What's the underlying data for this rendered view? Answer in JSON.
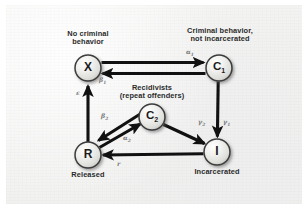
{
  "diagram": {
    "background_color": "#f2f2f1",
    "frame_color": "#ffffff",
    "node_fill": "#e9e9e7",
    "node_stroke": "#3c3c3c",
    "arrow_color": "#111111",
    "label_color": "#2b2b2b",
    "rate_color": "#7c7c7c"
  },
  "nodes": [
    {
      "id": "X",
      "label": "X",
      "sub": "",
      "cx": 88,
      "cy": 68,
      "r": 13,
      "caption": "No criminal\nbehavior",
      "caption_pos": "above"
    },
    {
      "id": "C1",
      "label": "C",
      "sub": "1",
      "cx": 219,
      "cy": 68,
      "r": 13,
      "caption": "Criminal behavior,\nnot incarcerated",
      "caption_pos": "above"
    },
    {
      "id": "C2",
      "label": "C",
      "sub": "2",
      "cx": 152,
      "cy": 117,
      "r": 13,
      "caption": "Recidivists\n(repeat offenders)",
      "caption_pos": "above"
    },
    {
      "id": "R",
      "label": "R",
      "sub": "",
      "cx": 88,
      "cy": 155,
      "r": 13,
      "caption": "Released",
      "caption_pos": "below"
    },
    {
      "id": "I",
      "label": "I",
      "sub": "",
      "cx": 217,
      "cy": 152,
      "r": 13,
      "caption": "Incarcerated",
      "caption_pos": "below"
    }
  ],
  "edges": [
    {
      "id": "x-to-c1",
      "from": "X",
      "to": "C1",
      "rate": "α",
      "rate_sub": "1",
      "rate_x": 188,
      "rate_y": 50
    },
    {
      "id": "c1-to-x",
      "from": "C1",
      "to": "X",
      "rate": "β",
      "rate_sub": "1",
      "rate_x": 101,
      "rate_y": 79
    },
    {
      "id": "c1-to-i",
      "from": "C1",
      "to": "I",
      "rate": "γ",
      "rate_sub": "1",
      "rate_x": 224,
      "rate_y": 122
    },
    {
      "id": "c2-to-i",
      "from": "C2",
      "to": "I",
      "rate": "γ",
      "rate_sub": "2",
      "rate_x": 199,
      "rate_y": 122
    },
    {
      "id": "i-to-r",
      "from": "I",
      "to": "R",
      "rate": "r",
      "rate_sub": "",
      "rate_x": 119,
      "rate_y": 163
    },
    {
      "id": "r-to-c2",
      "from": "R",
      "to": "C2",
      "rate": "α",
      "rate_sub": "2",
      "rate_x": 125,
      "rate_y": 137
    },
    {
      "id": "c2-to-r",
      "from": "C2",
      "to": "R",
      "rate": "β",
      "rate_sub": "2",
      "rate_x": 103,
      "rate_y": 117
    },
    {
      "id": "r-to-x",
      "from": "R",
      "to": "X",
      "rate": "ε",
      "rate_sub": "",
      "rate_x": 77,
      "rate_y": 93
    }
  ],
  "captions": {
    "no_criminal_behavior": "No criminal\nbehavior",
    "criminal_not_incarcerated": "Criminal behavior,\nnot incarcerated",
    "recidivists": "Recidivists\n(repeat offenders)",
    "released": "Released",
    "incarcerated": "Incarcerated"
  },
  "node_labels": {
    "x": "X",
    "c1": "C",
    "c1_sub": "1",
    "c2": "C",
    "c2_sub": "2",
    "r": "R",
    "i": "I"
  },
  "rates": {
    "alpha1": "α",
    "alpha1_sub": "1",
    "beta1": "β",
    "beta1_sub": "1",
    "alpha2": "α",
    "alpha2_sub": "2",
    "beta2": "β",
    "beta2_sub": "2",
    "gamma1": "γ",
    "gamma1_sub": "1",
    "gamma2": "γ",
    "gamma2_sub": "2",
    "epsilon": "ε",
    "r": "r"
  }
}
